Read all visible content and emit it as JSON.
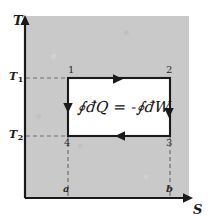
{
  "figure": {
    "kind": "thermodynamic-cycle-diagram",
    "background_color": "#ffffff",
    "plot_fill_color": "#c9c9c9",
    "cycle_fill_color": "#ffffff",
    "ink_color": "#1a1a1a"
  },
  "axes": {
    "y_label": "T",
    "x_label": "S",
    "y_ticks": [
      {
        "label": "T",
        "subscript": "1"
      },
      {
        "label": "T",
        "subscript": "2"
      }
    ],
    "x_ticks": [
      {
        "label": "a"
      },
      {
        "label": "b"
      }
    ]
  },
  "cycle": {
    "corner_labels": [
      "1",
      "2",
      "3",
      "4"
    ],
    "direction": "clockwise",
    "edges": [
      {
        "name": "top",
        "from": "1",
        "to": "2",
        "arrow": "right",
        "process": "isothermal"
      },
      {
        "name": "right",
        "from": "2",
        "to": "3",
        "arrow": "down",
        "process": "isentropic"
      },
      {
        "name": "bottom",
        "from": "3",
        "to": "4",
        "arrow": "left",
        "process": "isothermal"
      },
      {
        "name": "left",
        "from": "4",
        "to": "1",
        "arrow": "up",
        "process": "isentropic"
      }
    ]
  },
  "equation": {
    "text": "∮đQ = -∮đW",
    "left_integral": "∮",
    "left_term": "đQ",
    "operator": "=",
    "sign": "-",
    "right_integral": "∮",
    "right_term": "đW"
  }
}
